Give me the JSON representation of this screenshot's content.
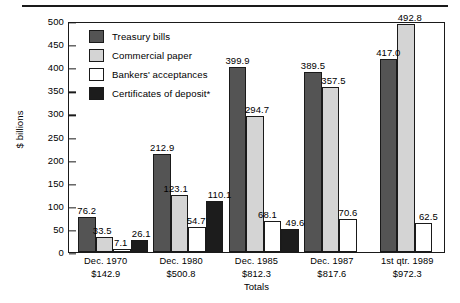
{
  "chart_data": {
    "type": "bar",
    "title": "",
    "xlabel": "Totals",
    "ylabel": "$ billions",
    "ylim": [
      0,
      500
    ],
    "yticks": [
      0,
      50,
      100,
      150,
      200,
      250,
      300,
      350,
      400,
      450,
      500
    ],
    "grid": false,
    "legend_position": "inside-upper-left",
    "categories": [
      "Dec. 1970",
      "Dec. 1980",
      "Dec. 1985",
      "Dec. 1987",
      "1st qtr. 1989"
    ],
    "category_totals": [
      "$142.9",
      "$500.8",
      "$812.3",
      "$817.6",
      "$972.3"
    ],
    "series": [
      {
        "name": "Treasury bills",
        "color": "#545454",
        "values": [
          76.2,
          212.9,
          399.9,
          389.5,
          417.0
        ],
        "labels": [
          "76.2",
          "212.9",
          "399.9",
          "389.5",
          "417.0"
        ]
      },
      {
        "name": "Commercial paper",
        "color": "#d4d4d4",
        "values": [
          33.5,
          123.1,
          294.7,
          357.5,
          492.8
        ],
        "labels": [
          "33.5",
          "123.1",
          "294.7",
          "357.5",
          "492.8"
        ]
      },
      {
        "name": "Bankers' acceptances",
        "color": "#ffffff",
        "values": [
          7.1,
          54.7,
          68.1,
          70.6,
          62.5
        ],
        "labels": [
          "7.1",
          "54.7",
          "68.1",
          "70.6",
          "62.5"
        ]
      },
      {
        "name": "Certificates of deposit*",
        "color": "#1c1c1c",
        "values": [
          26.1,
          110.1,
          49.6,
          null,
          null
        ],
        "labels": [
          "26.1",
          "110.1",
          "49.6",
          "",
          ""
        ]
      }
    ]
  },
  "axis": {
    "y_title": "$ billions",
    "x_title": "Totals",
    "y_tick_labels": [
      "500",
      "450",
      "400",
      "350",
      "300",
      "250",
      "200",
      "150",
      "100",
      "50",
      "0"
    ]
  },
  "legend": {
    "items": [
      {
        "label": "Treasury bills",
        "swatch": "#545454"
      },
      {
        "label": "Commercial paper",
        "swatch": "#d4d4d4"
      },
      {
        "label": "Bankers' acceptances",
        "swatch": "#ffffff"
      },
      {
        "label": "Certificates of deposit*",
        "swatch": "#1c1c1c"
      }
    ]
  }
}
